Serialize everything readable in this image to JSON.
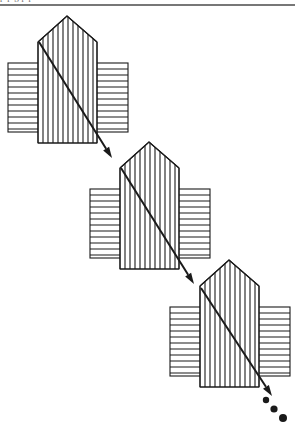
{
  "figure": {
    "caption_fragment_clipped": "p  p      g          p      p",
    "ink_color": "#1a1a1a",
    "background_color": "#ffffff",
    "rule_color": "#4a4a4a",
    "top_rule": {
      "x1": 0,
      "y1": 5,
      "x2": 295,
      "y2": 5,
      "width": 1.6
    },
    "glyph_geometry": {
      "house_left": 38,
      "house_right": 97,
      "house_body_top": 42,
      "house_body_bottom": 143,
      "roof_apex_x": 67,
      "roof_apex_y": 16,
      "rect_left": 8,
      "rect_right": 128,
      "rect_top": 63,
      "rect_bottom": 132,
      "vertical_hatch_spacing": 5,
      "horizontal_hatch_spacing": 6,
      "hatch_stroke_width": 1.1,
      "outline_stroke_width": 1.1
    },
    "instances": [
      {
        "name": "glyph-1",
        "dx": 0,
        "dy": 0
      },
      {
        "name": "glyph-2",
        "dx": 82,
        "dy": 126
      },
      {
        "name": "glyph-3",
        "dx": 162,
        "dy": 244
      }
    ],
    "arrow": {
      "stroke_width": 2.0,
      "segments": [
        {
          "name": "arrow-segment-1",
          "x1": 39,
          "y1": 42,
          "x2": 112,
          "y2": 158,
          "head": true
        },
        {
          "name": "arrow-segment-2",
          "x1": 121,
          "y1": 168,
          "x2": 194,
          "y2": 284,
          "head": true
        },
        {
          "name": "arrow-segment-3",
          "x1": 201,
          "y1": 288,
          "x2": 272,
          "y2": 396,
          "head": true
        }
      ],
      "head_length": 11,
      "head_width": 7
    },
    "dots": [
      {
        "name": "trailing-dot-1",
        "cx": 266,
        "cy": 400,
        "r": 3.2
      },
      {
        "name": "trailing-dot-2",
        "cx": 274,
        "cy": 409,
        "r": 3.6
      },
      {
        "name": "trailing-dot-3",
        "cx": 283,
        "cy": 418,
        "r": 4.0
      }
    ]
  }
}
